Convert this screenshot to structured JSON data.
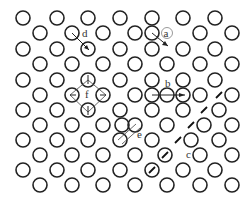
{
  "figure": {
    "circle_radius": 7,
    "stroke_color": "#222222",
    "background": "#ffffff",
    "rows": [
      {
        "y": 18,
        "x": [
          23,
          57,
          88,
          120,
          152,
          183,
          215
        ]
      },
      {
        "y": 33,
        "x": [
          40,
          72,
          103,
          135,
          152,
          200,
          232
        ]
      },
      {
        "y": 49,
        "x": [
          23,
          57,
          88,
          120,
          152,
          183,
          215
        ]
      },
      {
        "y": 64,
        "x": [
          40,
          72,
          103,
          135,
          167,
          200,
          232
        ]
      },
      {
        "y": 80,
        "x": [
          23,
          57,
          88,
          120,
          152,
          183,
          215
        ]
      },
      {
        "y": 95,
        "x": [
          40,
          72,
          103,
          135,
          152,
          167,
          183,
          200,
          232
        ]
      },
      {
        "y": 110,
        "x": [
          23,
          57,
          88,
          120,
          152,
          183,
          219
        ]
      },
      {
        "y": 125,
        "x": [
          40,
          72,
          103,
          122,
          135,
          167,
          204,
          232
        ]
      },
      {
        "y": 140,
        "x": [
          23,
          57,
          88,
          120,
          152,
          191,
          219
        ]
      },
      {
        "y": 155,
        "x": [
          40,
          72,
          103,
          135,
          165,
          200,
          232
        ]
      },
      {
        "y": 170,
        "x": [
          23,
          57,
          88,
          120,
          152,
          183,
          215
        ]
      },
      {
        "y": 185,
        "x": [
          40,
          72,
          103,
          135,
          167,
          200,
          232
        ]
      }
    ],
    "labels": {
      "a": "a",
      "b": "b",
      "c": "c",
      "d": "d",
      "e": "e",
      "f": "f"
    }
  }
}
